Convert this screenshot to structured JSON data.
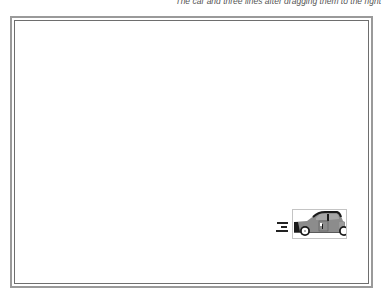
{
  "caption": {
    "text": "The car and three lines after dragging them to the right"
  },
  "canvas": {
    "border_color": "#9a9a9a",
    "inner_border_color": "#6e6e6e",
    "background": "#ffffff"
  },
  "objects": {
    "car": {
      "label": "car",
      "body_color": "#8c8c8c",
      "dark_color": "#1a1a1a",
      "wheel_color": "#ffffff",
      "selection_border_color": "#c4c4c4"
    },
    "lines": {
      "count": 3,
      "color": "#222222"
    }
  }
}
